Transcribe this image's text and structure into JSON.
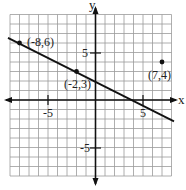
{
  "chart_data": {
    "type": "scatter",
    "title": "",
    "xlabel": "x",
    "ylabel": "y",
    "xlim": [
      -9,
      8
    ],
    "ylim": [
      -8,
      9
    ],
    "grid": true,
    "tick_labels": {
      "x": [
        "-5",
        "5"
      ],
      "y": [
        "5",
        "-5"
      ]
    },
    "line": {
      "through": [
        [
          -8,
          6
        ],
        [
          -2,
          3
        ]
      ],
      "slope": -0.5,
      "intercept": 2
    },
    "points": [
      {
        "label": "(-8,6)",
        "x": -8,
        "y": 6
      },
      {
        "label": "(-2,3)",
        "x": -2,
        "y": 3
      },
      {
        "label": "(7,4)",
        "x": 7,
        "y": 4
      }
    ]
  },
  "labels": {
    "x_axis": "x",
    "y_axis": "y",
    "tick_x_neg": "-5",
    "tick_x_pos": "5",
    "tick_y_pos": "5",
    "tick_y_neg": "-5",
    "p1": "(-8,6)",
    "p2": "(-2,3)",
    "p3": "(7,4)"
  }
}
